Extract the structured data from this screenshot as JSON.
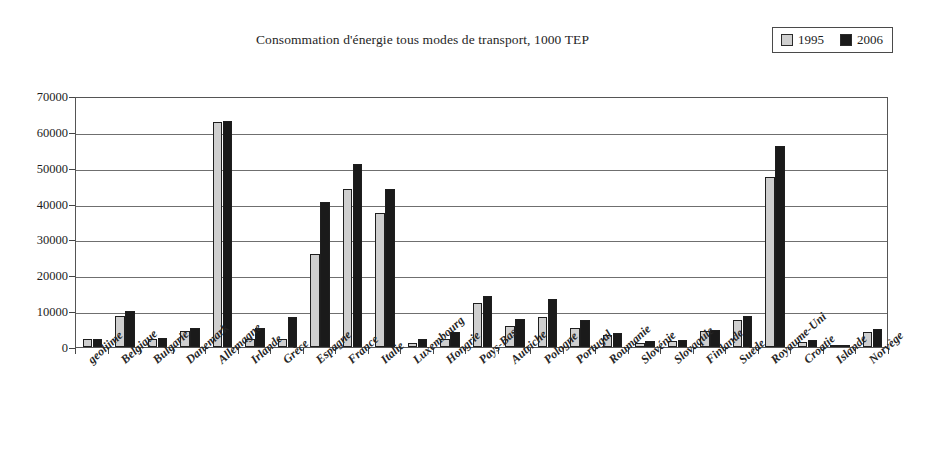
{
  "chart_data": {
    "type": "bar",
    "title": "Consommation d'énergie tous modes de transport, 1000 TEP",
    "xlabel": "",
    "ylabel": "",
    "ylim": [
      0,
      70000
    ],
    "yticks": [
      0,
      10000,
      20000,
      30000,
      40000,
      50000,
      60000,
      70000
    ],
    "ytick_labels": [
      "0",
      "10000",
      "20000",
      "30000",
      "40000",
      "50000",
      "60000",
      "70000"
    ],
    "grid": true,
    "legend_position": "top-right",
    "categories": [
      "geoliime",
      "Belgique",
      "Bulgarie",
      "Danemark",
      "Allemagne",
      "Irlande",
      "Grèce",
      "Espagne",
      "France",
      "Italie",
      "Luxembourg",
      "Hongrie",
      "Pays-Bas",
      "Autriche",
      "Pologne",
      "Portugal",
      "Roumanie",
      "Slovénie",
      "Slovaquie",
      "Finlande",
      "Suède",
      "Royaume-Uni",
      "Croatie",
      "Islande",
      "Norvège"
    ],
    "series": [
      {
        "name": "1995",
        "color": "#cfcfcf",
        "values": [
          2200,
          8600,
          2200,
          4600,
          62800,
          2300,
          2300,
          26000,
          44000,
          37500,
          1200,
          2300,
          12300,
          5800,
          8500,
          5200,
          3300,
          1200,
          1700,
          4400,
          7600,
          47300,
          1300,
          400,
          4200
        ]
      },
      {
        "name": "2006",
        "color": "#1a1a1a",
        "values": [
          2300,
          10000,
          2400,
          5300,
          63000,
          5400,
          8500,
          40500,
          51000,
          44000,
          2300,
          4300,
          14300,
          7700,
          13400,
          7400,
          4000,
          1600,
          1900,
          4700,
          8700,
          56000,
          2000,
          700,
          5000
        ]
      }
    ]
  },
  "legend": {
    "entries": [
      {
        "label": "1995",
        "swatch": "light-gray-square"
      },
      {
        "label": "2006",
        "swatch": "black-square"
      }
    ]
  },
  "colors": {
    "series_1995": "#cfcfcf",
    "series_2006": "#1a1a1a",
    "axis": "#555555",
    "gridline": "#6f6f6f",
    "background": "#ffffff",
    "text": "#1c1c1c"
  }
}
